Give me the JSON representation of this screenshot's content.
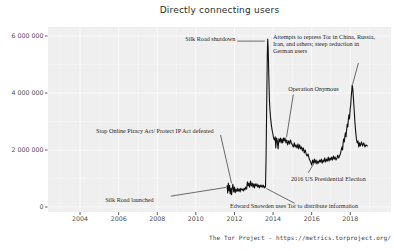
{
  "chart_data": {
    "type": "line",
    "title": "Directly connecting users",
    "caption": "The Tor Project - https://metrics.torproject.org/",
    "xlabel": "",
    "ylabel": "",
    "xlim": [
      2002.34,
      2020.11
    ],
    "ylim": [
      -175000,
      6315000
    ],
    "grid": true,
    "legend_position": "none",
    "x_ticks": {
      "values": [
        2004,
        2006,
        2008,
        2010,
        2012,
        2014,
        2016,
        2018
      ],
      "labels": [
        "2004",
        "2006",
        "2008",
        "2010",
        "2012",
        "2014",
        "2016",
        "2018"
      ],
      "minor": [
        2003,
        2005,
        2007,
        2009,
        2011,
        2013,
        2015,
        2017,
        2019
      ]
    },
    "y_ticks": {
      "values": [
        0,
        2000000,
        4000000,
        6000000
      ],
      "labels": [
        "0",
        "2 000 000",
        "4 000 000",
        "6 000 000"
      ],
      "minor": [
        1000000,
        3000000,
        5000000
      ]
    },
    "colors": {
      "background": "#ffffff",
      "panel_bg": "#efefef",
      "grid_major": "#fafafa",
      "grid_minor": "#f5f5f5",
      "line": "#111111",
      "tick": "#333333",
      "tick_label": "#4d4d4d",
      "annotation": "#1f1f1f",
      "pointer": "#5a5a5a"
    },
    "series": [
      {
        "name": "directly_connecting_users",
        "points": [
          [
            2011.62,
            740000
          ],
          [
            2011.65,
            490000
          ],
          [
            2011.68,
            840000
          ],
          [
            2011.72,
            560000
          ],
          [
            2011.75,
            760000
          ],
          [
            2011.78,
            460000
          ],
          [
            2011.82,
            660000
          ],
          [
            2011.85,
            430000
          ],
          [
            2011.88,
            620000
          ],
          [
            2011.92,
            800000
          ],
          [
            2011.96,
            530000
          ],
          [
            2012.0,
            700000
          ],
          [
            2012.04,
            500000
          ],
          [
            2012.08,
            630000
          ],
          [
            2012.13,
            540000
          ],
          [
            2012.17,
            660000
          ],
          [
            2012.21,
            560000
          ],
          [
            2012.25,
            630000
          ],
          [
            2012.29,
            530000
          ],
          [
            2012.33,
            660000
          ],
          [
            2012.38,
            600000
          ],
          [
            2012.42,
            630000
          ],
          [
            2012.46,
            560000
          ],
          [
            2012.5,
            660000
          ],
          [
            2012.54,
            600000
          ],
          [
            2012.58,
            700000
          ],
          [
            2012.63,
            630000
          ],
          [
            2012.67,
            880000
          ],
          [
            2012.71,
            740000
          ],
          [
            2012.75,
            840000
          ],
          [
            2012.79,
            700000
          ],
          [
            2012.83,
            910000
          ],
          [
            2012.88,
            740000
          ],
          [
            2012.92,
            840000
          ],
          [
            2012.96,
            700000
          ],
          [
            2013.0,
            810000
          ],
          [
            2013.04,
            670000
          ],
          [
            2013.08,
            810000
          ],
          [
            2013.13,
            740000
          ],
          [
            2013.17,
            810000
          ],
          [
            2013.21,
            700000
          ],
          [
            2013.25,
            770000
          ],
          [
            2013.29,
            670000
          ],
          [
            2013.33,
            770000
          ],
          [
            2013.38,
            700000
          ],
          [
            2013.42,
            770000
          ],
          [
            2013.46,
            700000
          ],
          [
            2013.5,
            760000
          ],
          [
            2013.54,
            670000
          ],
          [
            2013.58,
            730000
          ],
          [
            2013.61,
            700000
          ],
          [
            2013.64,
            1800000
          ],
          [
            2013.67,
            3600000
          ],
          [
            2013.7,
            5300000
          ],
          [
            2013.72,
            5890000
          ],
          [
            2013.75,
            5550000
          ],
          [
            2013.78,
            4600000
          ],
          [
            2013.81,
            3750000
          ],
          [
            2013.84,
            3380000
          ],
          [
            2013.87,
            3120000
          ],
          [
            2013.91,
            2890000
          ],
          [
            2013.95,
            2700000
          ],
          [
            2013.99,
            2560000
          ],
          [
            2014.03,
            2420000
          ],
          [
            2014.07,
            2350000
          ],
          [
            2014.11,
            2460000
          ],
          [
            2014.14,
            2070000
          ],
          [
            2014.18,
            2420000
          ],
          [
            2014.22,
            2320000
          ],
          [
            2014.26,
            2040000
          ],
          [
            2014.3,
            2390000
          ],
          [
            2014.34,
            2280000
          ],
          [
            2014.38,
            2420000
          ],
          [
            2014.42,
            2250000
          ],
          [
            2014.46,
            2390000
          ],
          [
            2014.5,
            2250000
          ],
          [
            2014.54,
            2420000
          ],
          [
            2014.58,
            2320000
          ],
          [
            2014.62,
            2420000
          ],
          [
            2014.67,
            2250000
          ],
          [
            2014.71,
            2350000
          ],
          [
            2014.76,
            2180000
          ],
          [
            2014.81,
            2320000
          ],
          [
            2014.86,
            2210000
          ],
          [
            2014.9,
            2350000
          ],
          [
            2014.95,
            2250000
          ],
          [
            2015.0,
            2180000
          ],
          [
            2015.05,
            2110000
          ],
          [
            2015.1,
            2250000
          ],
          [
            2015.14,
            2110000
          ],
          [
            2015.19,
            2180000
          ],
          [
            2015.24,
            2070000
          ],
          [
            2015.29,
            2210000
          ],
          [
            2015.33,
            2040000
          ],
          [
            2015.38,
            2180000
          ],
          [
            2015.43,
            2040000
          ],
          [
            2015.48,
            2110000
          ],
          [
            2015.52,
            1970000
          ],
          [
            2015.57,
            2070000
          ],
          [
            2015.62,
            1900000
          ],
          [
            2015.67,
            2000000
          ],
          [
            2015.71,
            1860000
          ],
          [
            2015.76,
            1790000
          ],
          [
            2015.81,
            1860000
          ],
          [
            2015.86,
            1720000
          ],
          [
            2015.9,
            1650000
          ],
          [
            2015.95,
            1580000
          ],
          [
            2016.0,
            1470000
          ],
          [
            2016.05,
            1650000
          ],
          [
            2016.09,
            1540000
          ],
          [
            2016.14,
            1680000
          ],
          [
            2016.18,
            1540000
          ],
          [
            2016.23,
            1650000
          ],
          [
            2016.27,
            1510000
          ],
          [
            2016.32,
            1610000
          ],
          [
            2016.36,
            1540000
          ],
          [
            2016.41,
            1650000
          ],
          [
            2016.45,
            1580000
          ],
          [
            2016.5,
            1680000
          ],
          [
            2016.54,
            1540000
          ],
          [
            2016.59,
            1650000
          ],
          [
            2016.63,
            1580000
          ],
          [
            2016.68,
            1720000
          ],
          [
            2016.72,
            1580000
          ],
          [
            2016.77,
            1680000
          ],
          [
            2016.81,
            1610000
          ],
          [
            2016.86,
            1750000
          ],
          [
            2016.9,
            1610000
          ],
          [
            2016.95,
            1720000
          ],
          [
            2016.99,
            1650000
          ],
          [
            2017.04,
            1750000
          ],
          [
            2017.08,
            1650000
          ],
          [
            2017.13,
            1790000
          ],
          [
            2017.17,
            1680000
          ],
          [
            2017.22,
            1750000
          ],
          [
            2017.26,
            1650000
          ],
          [
            2017.31,
            1720000
          ],
          [
            2017.35,
            1820000
          ],
          [
            2017.4,
            1720000
          ],
          [
            2017.44,
            1790000
          ],
          [
            2017.49,
            1860000
          ],
          [
            2017.53,
            2000000
          ],
          [
            2017.57,
            2110000
          ],
          [
            2017.6,
            2000000
          ],
          [
            2017.63,
            2250000
          ],
          [
            2017.66,
            2390000
          ],
          [
            2017.69,
            2280000
          ],
          [
            2017.72,
            2490000
          ],
          [
            2017.75,
            2600000
          ],
          [
            2017.78,
            2460000
          ],
          [
            2017.81,
            2700000
          ],
          [
            2017.84,
            2910000
          ],
          [
            2017.87,
            2810000
          ],
          [
            2017.9,
            3050000
          ],
          [
            2017.93,
            3230000
          ],
          [
            2017.96,
            3090000
          ],
          [
            2017.99,
            3400000
          ],
          [
            2018.02,
            3580000
          ],
          [
            2018.05,
            3860000
          ],
          [
            2018.08,
            4100000
          ],
          [
            2018.1,
            4280000
          ],
          [
            2018.13,
            4140000
          ],
          [
            2018.16,
            3820000
          ],
          [
            2018.2,
            3440000
          ],
          [
            2018.24,
            2980000
          ],
          [
            2018.28,
            2630000
          ],
          [
            2018.32,
            2390000
          ],
          [
            2018.36,
            2250000
          ],
          [
            2018.4,
            2320000
          ],
          [
            2018.44,
            2110000
          ],
          [
            2018.48,
            2250000
          ],
          [
            2018.52,
            2140000
          ],
          [
            2018.58,
            2280000
          ],
          [
            2018.64,
            2140000
          ],
          [
            2018.7,
            2250000
          ],
          [
            2018.76,
            2110000
          ],
          [
            2018.82,
            2180000
          ],
          [
            2018.88,
            2140000
          ]
        ]
      }
    ],
    "annotations": [
      {
        "id": "silk-road-shutdown",
        "lines": [
          "Silk Road shutdown"
        ],
        "anchor": "end",
        "x": 2012.05,
        "y": 5860000,
        "vbaseline": "middle",
        "pointer": [
          [
            2012.15,
            5820000
          ],
          [
            2013.57,
            5820000
          ]
        ]
      },
      {
        "id": "repression-2018",
        "lines": [
          "Attempts to repress Tor in China, Russia,",
          "Iran, and others; steep reduction in",
          "German users"
        ],
        "anchor": "start",
        "x": 2014.0,
        "y": 5895000,
        "vbaseline": "alphabetic",
        "pointer": [
          [
            2018.42,
            5050000
          ],
          [
            2018.12,
            4300000
          ]
        ]
      },
      {
        "id": "operation-onymous",
        "lines": [
          "Operation Onymous"
        ],
        "anchor": "start",
        "x": 2014.79,
        "y": 4070000,
        "vbaseline": "alphabetic",
        "pointer": [
          [
            2015.05,
            3950000
          ],
          [
            2014.7,
            2450000
          ]
        ]
      },
      {
        "id": "sopa-pipa-defeated",
        "lines": [
          "Stop Online Piracy Act/ Protect IP Act defeated"
        ],
        "anchor": "start",
        "x": 2004.83,
        "y": 2580000,
        "vbaseline": "alphabetic",
        "pointer": [
          [
            2011.28,
            2530000
          ],
          [
            2011.85,
            830000
          ]
        ]
      },
      {
        "id": "election-2016",
        "lines": [
          "2016 US Presidential Election"
        ],
        "anchor": "start",
        "x": 2014.93,
        "y": 900000,
        "vbaseline": "alphabetic",
        "pointer": [
          [
            2015.82,
            1200000
          ],
          [
            2016.12,
            1530000
          ]
        ]
      },
      {
        "id": "silk-road-launched",
        "lines": [
          "Silk Road launched"
        ],
        "anchor": "start",
        "x": 2005.3,
        "y": 160000,
        "vbaseline": "alphabetic",
        "pointer": [
          [
            2008.7,
            380000
          ],
          [
            2011.58,
            690000
          ]
        ]
      },
      {
        "id": "snowden",
        "lines": [
          "Edward Snowden uses Tor to distribute information"
        ],
        "anchor": "start",
        "x": 2011.77,
        "y": -35000,
        "vbaseline": "alphabetic",
        "pointer": [
          [
            2013.65,
            650000
          ],
          [
            2015.12,
            130000
          ]
        ]
      }
    ]
  }
}
